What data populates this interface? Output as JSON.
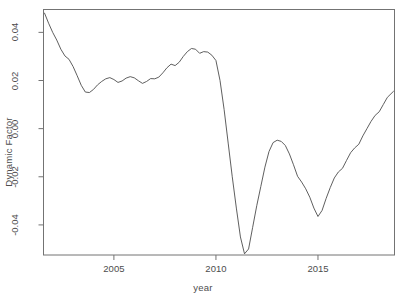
{
  "chart_data": {
    "type": "line",
    "title": "",
    "xlabel": "year",
    "ylabel": "Dynamic Factor",
    "xlim": [
      2001.55,
      2018.75
    ],
    "ylim": [
      -0.0525,
      0.0495
    ],
    "xticks": [
      2005,
      2010,
      2015
    ],
    "xtick_labels": [
      "2005",
      "2010",
      "2015"
    ],
    "yticks": [
      0.04,
      0.02,
      0.0,
      -0.02,
      -0.04
    ],
    "ytick_labels": [
      "0.04",
      "0.02",
      "0.00",
      "-0.02",
      "-0.04"
    ],
    "grid": false,
    "legend": null,
    "line_color": "#4d4d4d",
    "line_width": 0.9,
    "series": [
      {
        "name": "Dynamic Factor",
        "x": [
          2001.6,
          2001.8,
          2002.0,
          2002.2,
          2002.4,
          2002.6,
          2002.8,
          2003.0,
          2003.2,
          2003.4,
          2003.6,
          2003.8,
          2004.0,
          2004.2,
          2004.4,
          2004.6,
          2004.8,
          2005.0,
          2005.2,
          2005.4,
          2005.6,
          2005.8,
          2006.0,
          2006.2,
          2006.4,
          2006.6,
          2006.8,
          2007.0,
          2007.2,
          2007.4,
          2007.6,
          2007.8,
          2008.0,
          2008.2,
          2008.4,
          2008.6,
          2008.8,
          2009.0,
          2009.2,
          2009.4,
          2009.6,
          2009.8,
          2010.0,
          2010.2,
          2010.4,
          2010.6,
          2010.8,
          2011.0,
          2011.2,
          2011.4,
          2011.6,
          2011.8,
          2012.0,
          2012.2,
          2012.4,
          2012.6,
          2012.8,
          2013.0,
          2013.2,
          2013.4,
          2013.6,
          2013.8,
          2014.0,
          2014.2,
          2014.4,
          2014.6,
          2014.8,
          2015.0,
          2015.2,
          2015.4,
          2015.6,
          2015.8,
          2016.0,
          2016.2,
          2016.4,
          2016.6,
          2016.8,
          2017.0,
          2017.2,
          2017.4,
          2017.6,
          2017.8,
          2018.0,
          2018.2,
          2018.4,
          2018.7
        ],
        "y": [
          0.048,
          0.0438,
          0.04,
          0.0368,
          0.033,
          0.0302,
          0.0288,
          0.0258,
          0.022,
          0.018,
          0.0152,
          0.015,
          0.0163,
          0.0182,
          0.0196,
          0.0207,
          0.0212,
          0.0204,
          0.0192,
          0.0198,
          0.021,
          0.0216,
          0.0211,
          0.0199,
          0.0188,
          0.0196,
          0.0208,
          0.0207,
          0.0214,
          0.0232,
          0.0253,
          0.0268,
          0.0262,
          0.0276,
          0.03,
          0.032,
          0.0333,
          0.033,
          0.0313,
          0.032,
          0.0318,
          0.0305,
          0.0283,
          0.02,
          0.008,
          -0.006,
          -0.02,
          -0.033,
          -0.045,
          -0.052,
          -0.05,
          -0.041,
          -0.032,
          -0.024,
          -0.016,
          -0.0095,
          -0.0058,
          -0.0048,
          -0.0053,
          -0.007,
          -0.0105,
          -0.015,
          -0.0198,
          -0.0222,
          -0.025,
          -0.0285,
          -0.033,
          -0.0365,
          -0.034,
          -0.029,
          -0.0245,
          -0.0205,
          -0.018,
          -0.0165,
          -0.0132,
          -0.01,
          -0.008,
          -0.0065,
          -0.003,
          0.0,
          0.003,
          0.0055,
          0.007,
          0.01,
          0.013,
          0.0155
        ]
      }
    ]
  }
}
